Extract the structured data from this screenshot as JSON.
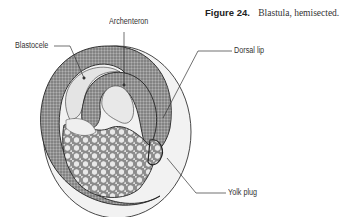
{
  "caption": {
    "number": "Figure 24.",
    "text": "Blastula, hemisected."
  },
  "labels": {
    "archenteron": "Archenteron",
    "blastocele": "Blastocele",
    "dorsal_lip": "Dorsal lip",
    "yolk_plug": "Yolk plug"
  },
  "colors": {
    "outline": "#222222",
    "ectoderm": "#8a8a8a",
    "cavity": "#e6e6e6",
    "yolk": "#c8c8c8",
    "shell": "#f0f0f0"
  }
}
